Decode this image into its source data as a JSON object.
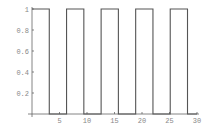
{
  "chart_data": {
    "type": "line",
    "title": "",
    "xlabel": "",
    "ylabel": "",
    "xlim": [
      0,
      30
    ],
    "ylim": [
      0,
      1
    ],
    "grid": false,
    "legend": "none",
    "x_ticks": [
      5,
      10,
      15,
      20,
      25,
      30
    ],
    "x_tick_labels": [
      "5",
      "10",
      "15",
      "20",
      "25",
      "30"
    ],
    "y_ticks": [
      0.2,
      0.4,
      0.6,
      0.8,
      1
    ],
    "y_tick_labels": [
      "0.2",
      "0.4",
      "0.6",
      "0.8",
      "1"
    ],
    "series": [
      {
        "name": "square wave",
        "color": "#555555",
        "x": [
          0,
          3.1416,
          3.1416,
          6.2832,
          6.2832,
          9.4248,
          9.4248,
          12.5664,
          12.5664,
          15.708,
          15.708,
          18.8496,
          18.8496,
          21.9911,
          21.9911,
          25.1327,
          25.1327,
          28.2743,
          28.2743,
          30
        ],
        "y": [
          1,
          1,
          0,
          0,
          1,
          1,
          0,
          0,
          1,
          1,
          0,
          0,
          1,
          1,
          0,
          0,
          1,
          1,
          0,
          0
        ]
      }
    ]
  }
}
